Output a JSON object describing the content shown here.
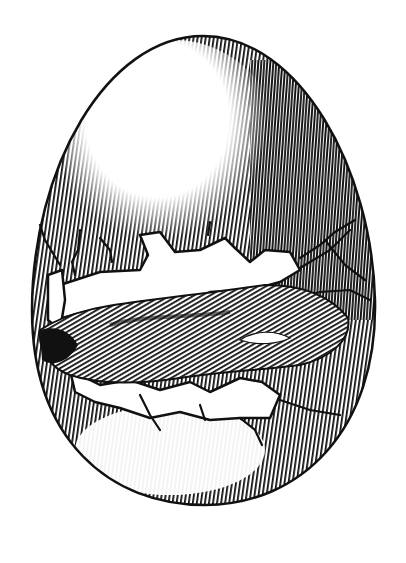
{
  "illustration": {
    "subject": "cracked-egg-engraving",
    "style": "black-and-white woodcut hatching",
    "colors": {
      "ink": "#111111",
      "paper": "#ffffff"
    },
    "egg": {
      "cx": 203,
      "cy": 272,
      "rx": 172,
      "ry": 236
    },
    "crack_band": {
      "top": 230,
      "bottom": 420
    }
  }
}
